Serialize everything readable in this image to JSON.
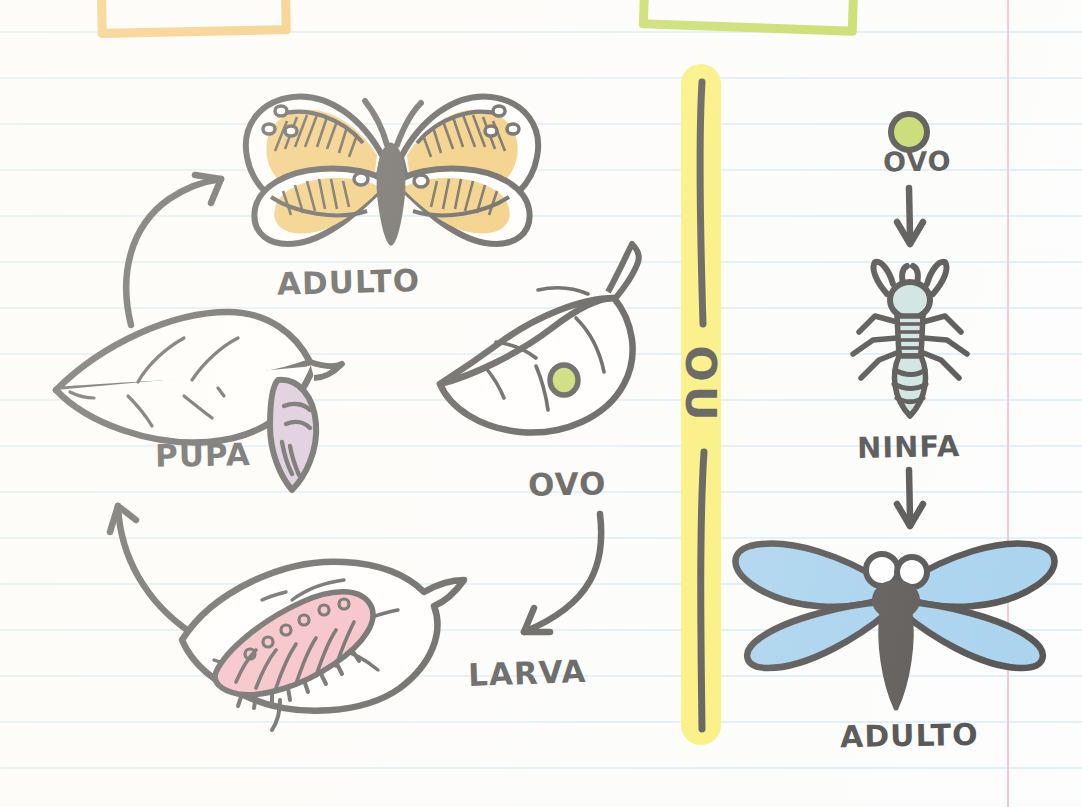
{
  "page": {
    "paper": {
      "background": "#fdfdfc",
      "rule_color": "#d6ecf5",
      "rule_spacing_px": 46,
      "margin_line_color": "#f3b5bf"
    }
  },
  "decorations": {
    "top_box_orange": {
      "name": "orange-highlight-box",
      "color": "#f2b33f"
    },
    "top_box_green": {
      "name": "green-highlight-box",
      "color": "#b5d133"
    }
  },
  "divider": {
    "name": "ou-divider",
    "text": "OU",
    "highlight_color": "#f9eb4e",
    "ink_color": "#171715"
  },
  "left_cycle": {
    "name": "complete-metamorphosis",
    "stages": [
      {
        "id": "adulto",
        "label": "ADULTO",
        "icon": "butterfly-icon",
        "color": "#edb745"
      },
      {
        "id": "ovo",
        "label": "OVO",
        "icon": "leaf-with-egg-icon",
        "color": "#b5ce3e"
      },
      {
        "id": "larva",
        "label": "LARVA",
        "icon": "caterpillar-icon",
        "color": "#f0a0ac"
      },
      {
        "id": "pupa",
        "label": "PUPA",
        "icon": "chrysalis-icon",
        "color": "#cdb0cd"
      }
    ],
    "arrows": [
      {
        "name": "arrow-ovo-to-larva",
        "direction": "down-left"
      },
      {
        "name": "arrow-larva-to-pupa",
        "direction": "up"
      },
      {
        "name": "arrow-pupa-to-adulto",
        "direction": "up-right"
      }
    ]
  },
  "right_cycle": {
    "name": "incomplete-metamorphosis",
    "stages": [
      {
        "id": "ovo",
        "label": "OVO",
        "icon": "egg-icon",
        "color": "#b5ce3e"
      },
      {
        "id": "ninfa",
        "label": "NINFA",
        "icon": "nymph-icon",
        "color": "#bfdcd8"
      },
      {
        "id": "adulto",
        "label": "ADULTO",
        "icon": "dragonfly-icon",
        "color": "#8dc5ea"
      }
    ],
    "arrows": [
      {
        "name": "arrow-ovo-to-ninfa",
        "direction": "down"
      },
      {
        "name": "arrow-ninfa-to-adulto",
        "direction": "down"
      }
    ]
  },
  "palette": {
    "ink": "#171715",
    "butterfly_orange": "#edb745",
    "egg_green": "#b5ce3e",
    "larva_pink": "#f0a0ac",
    "pupa_mauve": "#cdb0cd",
    "nymph_teal": "#bfdcd8",
    "dragonfly_blue": "#8dc5ea",
    "highlight_yellow": "#f9eb4e"
  }
}
